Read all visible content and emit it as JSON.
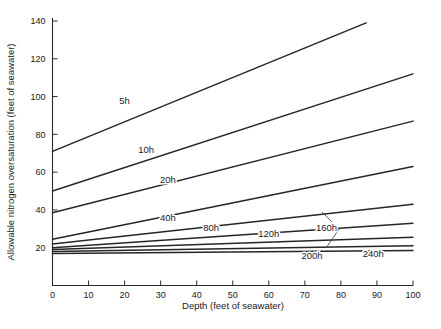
{
  "chart_data": {
    "type": "line",
    "title": "",
    "xlabel": "Depth   (feet of seawater)",
    "ylabel": "Allowable nitrogen oversaturation   (feet of seawater)",
    "xlim": [
      0,
      100
    ],
    "ylim": [
      0,
      145
    ],
    "xticks": [
      0,
      10,
      20,
      30,
      40,
      50,
      60,
      70,
      80,
      90,
      100
    ],
    "yticks": [
      20,
      40,
      60,
      80,
      100,
      120,
      140
    ],
    "xtick_labels": [
      "0",
      "10",
      "20",
      "30",
      "40",
      "50",
      "60",
      "70",
      "80",
      "90",
      "100"
    ],
    "ytick_labels": [
      "20",
      "40",
      "60",
      "80",
      "100",
      "120",
      "140"
    ],
    "grid": false,
    "legend": "inline-curve-labels",
    "line_color": "#262626",
    "series": [
      {
        "name": "5h",
        "label": "5h",
        "x": [
          0,
          87
        ],
        "values": [
          71,
          139
        ]
      },
      {
        "name": "10h",
        "label": "10h",
        "x": [
          0,
          100
        ],
        "values": [
          50,
          112
        ]
      },
      {
        "name": "20h",
        "label": "20h",
        "x": [
          0,
          100
        ],
        "values": [
          38.5,
          87
        ]
      },
      {
        "name": "40h",
        "label": "40h",
        "x": [
          0,
          100
        ],
        "values": [
          24.5,
          63
        ]
      },
      {
        "name": "80h",
        "label": "80h",
        "x": [
          0,
          100
        ],
        "values": [
          22,
          43
        ]
      },
      {
        "name": "120h",
        "label": "120h",
        "x": [
          0,
          100
        ],
        "values": [
          20,
          33
        ]
      },
      {
        "name": "160h",
        "label": "160h",
        "x": [
          0,
          100
        ],
        "values": [
          19,
          25.5
        ]
      },
      {
        "name": "200h",
        "label": "200h",
        "x": [
          0,
          100
        ],
        "values": [
          18,
          21
        ]
      },
      {
        "name": "240h",
        "label": "240h",
        "x": [
          0,
          100
        ],
        "values": [
          17,
          18.5
        ]
      }
    ],
    "annotations": [
      {
        "text": "5h",
        "x": 20,
        "y": 96
      },
      {
        "text": "10h",
        "x": 26,
        "y": 70
      },
      {
        "text": "20h",
        "x": 32,
        "y": 54
      },
      {
        "text": "40h",
        "x": 32,
        "y": 34
      },
      {
        "text": "80h",
        "x": 44,
        "y": 29
      },
      {
        "text": "120h",
        "x": 60,
        "y": 25.5
      },
      {
        "text": "160h",
        "x": 76,
        "y": 29
      },
      {
        "text": "200h",
        "x": 72,
        "y": 14
      },
      {
        "text": "240h",
        "x": 89,
        "y": 15
      }
    ]
  }
}
